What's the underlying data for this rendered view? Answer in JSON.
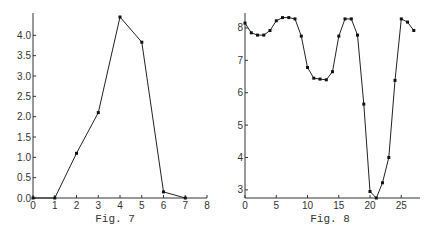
{
  "chart_data": [
    {
      "type": "line",
      "title": "",
      "caption": "Fig. 7",
      "xlabel": "",
      "ylabel": "",
      "x": [
        0,
        1,
        2,
        3,
        4,
        5,
        6,
        7
      ],
      "values": [
        0.0,
        0.0,
        1.1,
        2.1,
        4.45,
        3.83,
        0.15,
        0.0
      ],
      "xlim": [
        0,
        8
      ],
      "ylim": [
        0,
        4.5
      ],
      "xticks": [
        "0",
        "1",
        "2",
        "3",
        "4",
        "5",
        "6",
        "7",
        "8"
      ],
      "yticks": [
        "0.0",
        "0.5",
        "1.0",
        "1.5",
        "2.0",
        "2.5",
        "3.0",
        "3.5",
        "4.0"
      ],
      "grid": false,
      "markers": true
    },
    {
      "type": "line",
      "title": "",
      "caption": "Fig. 8",
      "xlabel": "",
      "ylabel": "",
      "x": [
        0,
        1,
        2,
        3,
        4,
        5,
        6,
        7,
        8,
        9,
        10,
        11,
        12,
        13,
        14,
        15,
        16,
        17,
        18,
        19,
        20,
        21,
        22,
        23,
        24,
        25,
        26,
        27
      ],
      "values": [
        8.15,
        7.85,
        7.78,
        7.78,
        7.92,
        8.22,
        8.32,
        8.32,
        8.28,
        7.75,
        6.78,
        6.45,
        6.42,
        6.4,
        6.65,
        7.75,
        8.28,
        8.28,
        7.78,
        5.65,
        2.95,
        2.75,
        3.22,
        4.0,
        6.38,
        8.28,
        8.18,
        7.92
      ],
      "xlim": [
        0,
        28
      ],
      "ylim": [
        2.75,
        8.4
      ],
      "xticks": [
        "0",
        "5",
        "10",
        "15",
        "20",
        "25"
      ],
      "yticks": [
        "3",
        "4",
        "5",
        "6",
        "7",
        "8"
      ],
      "grid": false,
      "markers": true
    }
  ]
}
